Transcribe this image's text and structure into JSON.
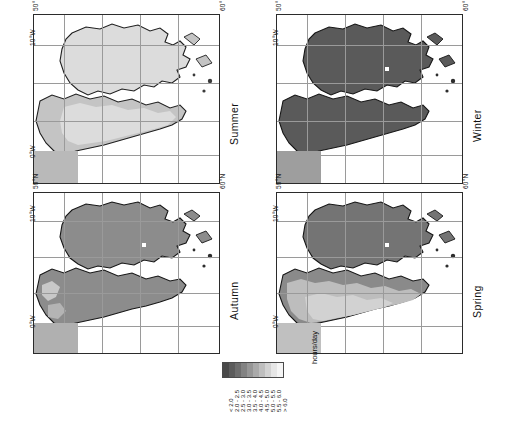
{
  "figure": {
    "kind": "seasonal-sunshine-duration-maps",
    "region": "British Isles",
    "orientation_note": "page rotated 90 degrees counter-clockwise"
  },
  "panels": [
    {
      "id": "summer",
      "label": "Summer",
      "position": "top-left"
    },
    {
      "id": "winter",
      "label": "Winter",
      "position": "top-right"
    },
    {
      "id": "autumn",
      "label": "Autumn",
      "position": "bottom-left"
    },
    {
      "id": "spring",
      "label": "Spring",
      "position": "bottom-right"
    }
  ],
  "axes": {
    "lat_ticks": [
      "50°N",
      "60°N"
    ],
    "lon_ticks": [
      "10°W",
      "0°W"
    ]
  },
  "legend": {
    "unit": "hours/day",
    "swatches": [
      {
        "label": "< 2.0",
        "color": "#4a4a4a"
      },
      {
        "label": "2.0 - 2.5",
        "color": "#5c5c5c"
      },
      {
        "label": "2.5 - 3.0",
        "color": "#6e6e6e"
      },
      {
        "label": "3.0 - 3.5",
        "color": "#828282"
      },
      {
        "label": "3.5 - 4.0",
        "color": "#969696"
      },
      {
        "label": "4.0 - 4.5",
        "color": "#aaaaaa"
      },
      {
        "label": "4.5 - 5.0",
        "color": "#bebebe"
      },
      {
        "label": "5.0 - 5.5",
        "color": "#d2d2d2"
      },
      {
        "label": "5.5 - 6.0",
        "color": "#e6e6e6"
      },
      {
        "label": "> 6.0",
        "color": "#f5f5f5"
      }
    ]
  },
  "chart_data": {
    "type": "heatmap",
    "title": "",
    "xlabel": "",
    "ylabel": "",
    "unit": "hours/day",
    "colorbar_bounds": [
      2.0,
      2.5,
      3.0,
      3.5,
      4.0,
      4.5,
      5.0,
      5.5,
      6.0
    ],
    "legend_position": "bottom-center",
    "grid": true,
    "panels": [
      {
        "name": "Summer",
        "typical_value": 5.5,
        "range": [
          4.0,
          6.5
        ],
        "description": "lightest shading; highest daily sunshine, brightest in the south and east"
      },
      {
        "name": "Winter",
        "typical_value": 1.8,
        "range": [
          1.0,
          2.5
        ],
        "description": "darkest shading; uniformly below 2.0 hours per day"
      },
      {
        "name": "Autumn",
        "typical_value": 3.2,
        "range": [
          2.5,
          4.5
        ],
        "description": "mid-grey shading; slightly brighter along the south coast"
      },
      {
        "name": "Spring",
        "typical_value": 4.3,
        "range": [
          3.5,
          5.5
        ],
        "description": "light-mid shading; brighter toward the south and south-east"
      }
    ]
  }
}
